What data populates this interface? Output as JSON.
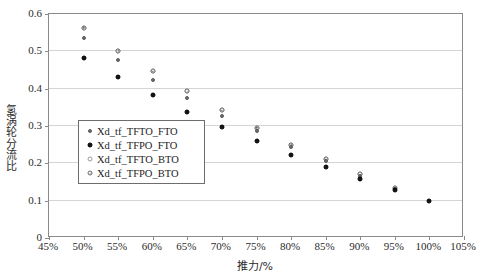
{
  "chart_data": {
    "type": "scatter",
    "title": "",
    "xlabel": "推力/%",
    "ylabel": "氢涡轮分流比",
    "xlim": [
      45,
      105
    ],
    "ylim": [
      0,
      0.6
    ],
    "xticks": [
      45,
      50,
      55,
      60,
      65,
      70,
      75,
      80,
      85,
      90,
      95,
      100,
      105
    ],
    "xtick_labels": [
      "45%",
      "50%",
      "55%",
      "60%",
      "65%",
      "70%",
      "75%",
      "80%",
      "85%",
      "90%",
      "95%",
      "100%",
      "105%"
    ],
    "yticks": [
      0,
      0.1,
      0.2,
      0.3,
      0.4,
      0.5,
      0.6
    ],
    "ytick_labels": [
      "0",
      "0.1",
      "0.2",
      "0.3",
      "0.4",
      "0.5",
      "0.6"
    ],
    "grid": "horizontal",
    "legend_position": "inside-left",
    "series": [
      {
        "name": "Xd_tf_TFTO_FTO",
        "marker": "small-filled-gray",
        "color": "#6e6e6e",
        "x": [
          50,
          55,
          60,
          65,
          70,
          75,
          80,
          85,
          90,
          95
        ],
        "y": [
          0.537,
          0.478,
          0.423,
          0.374,
          0.328,
          0.287,
          0.245,
          0.207,
          0.166,
          0.13
        ]
      },
      {
        "name": "Xd_tf_TFPO_FTO",
        "marker": "filled-black",
        "color": "#141414",
        "x": [
          50,
          55,
          60,
          65,
          70,
          75,
          80,
          85,
          90,
          95,
          100
        ],
        "y": [
          0.481,
          0.43,
          0.382,
          0.338,
          0.298,
          0.259,
          0.223,
          0.19,
          0.159,
          0.128,
          0.1
        ]
      },
      {
        "name": "Xd_tf_TFTO_BTO",
        "marker": "open-circle",
        "color": "#9a9a9a",
        "x": [
          50,
          55,
          60,
          65,
          70,
          75,
          80,
          85,
          90,
          95
        ],
        "y": [
          0.563,
          0.501,
          0.447,
          0.393,
          0.342,
          0.295,
          0.25,
          0.211,
          0.171,
          0.133
        ]
      },
      {
        "name": "Xd_tf_TFPO_BTO",
        "marker": "open-circle-dot",
        "color": "#6a6a6a",
        "x": [
          50,
          55,
          60,
          65,
          70,
          75,
          80,
          85,
          90,
          95
        ],
        "y": [
          0.563,
          0.501,
          0.447,
          0.393,
          0.342,
          0.295,
          0.25,
          0.211,
          0.171,
          0.133
        ]
      }
    ]
  }
}
